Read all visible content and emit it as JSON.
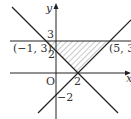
{
  "diagram": {
    "type": "coordinate-plane-region",
    "axes": {
      "x_label": "x",
      "y_label": "y",
      "origin_label": "O"
    },
    "lines": [
      {
        "name": "y = 3",
        "description": "horizontal line"
      },
      {
        "name": "y = -x + 2",
        "description": "decreasing line through (-1,3) and (2,0)"
      },
      {
        "name": "y = x - 2",
        "description": "increasing line through (2,0) and (5,3)"
      }
    ],
    "shaded_region": "triangle with vertices (-1, 3), (5, 3), (2, 0)",
    "labels": {
      "y3": "3",
      "y2": "2",
      "yneg2": "−2",
      "x2": "2",
      "pointA": "(−1, 3)",
      "pointB": "(5, 3)",
      "origin": "O",
      "xaxis": "x",
      "yaxis": "y"
    },
    "colors": {
      "line": "#222222",
      "hatch": "#666666",
      "background": "#ffffff"
    }
  }
}
